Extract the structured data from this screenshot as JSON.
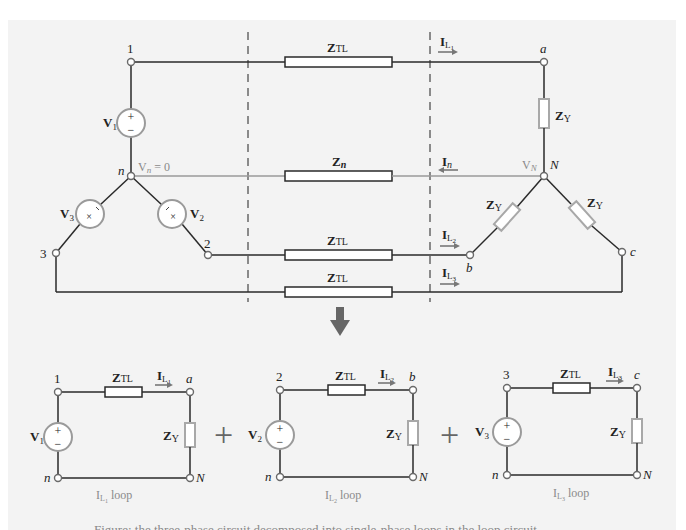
{
  "diagram": {
    "top_circuit": {
      "source_nodes": {
        "node1": "1",
        "node2": "2",
        "node3": "3",
        "neutral": "n"
      },
      "load_nodes": {
        "a": "a",
        "b": "b",
        "c": "c",
        "neutral": "N"
      },
      "sources": {
        "v1": "V",
        "v1_sub": "1",
        "v2": "V",
        "v2_sub": "2",
        "v3": "V",
        "v3_sub": "3"
      },
      "neutral_voltage_label": {
        "v": "V",
        "sub": "n",
        "rest": " = 0"
      },
      "load_neutral_voltage_label": {
        "v": "V",
        "sub": "N"
      },
      "line_impedance": {
        "z": "Z",
        "sub": "TL"
      },
      "neutral_impedance": {
        "z": "Z",
        "sub": "n"
      },
      "load_impedance": {
        "z": "Z",
        "sub": "Y"
      },
      "currents": {
        "il1": {
          "i": "I",
          "sub": "L",
          "subsub": "1"
        },
        "il2": {
          "i": "I",
          "sub": "L",
          "subsub": "2"
        },
        "il3": {
          "i": "I",
          "sub": "L",
          "subsub": "3"
        },
        "in": {
          "i": "I",
          "sub": "n"
        }
      }
    },
    "operator": "+",
    "loops": [
      {
        "source_node": "1",
        "load_node": "a",
        "v": "V",
        "v_sub": "1",
        "current_sub": "1",
        "caption_rest": " loop"
      },
      {
        "source_node": "2",
        "load_node": "b",
        "v": "V",
        "v_sub": "2",
        "current_sub": "2",
        "caption_rest": " loop"
      },
      {
        "source_node": "3",
        "load_node": "c",
        "v": "V",
        "v_sub": "3",
        "current_sub": "3",
        "caption_rest": " loop"
      }
    ],
    "loop_common": {
      "neutral_source": "n",
      "neutral_load": "N",
      "z": "Z",
      "ztl_sub": "TL",
      "zy_sub": "Y",
      "i": "I",
      "i_sub": "L",
      "plus": "+",
      "minus": "−"
    },
    "caption_clipped": "Figure: the three-phase circuit decomposed into single-phase loops in the loop circuit"
  },
  "colors": {
    "panel_bg": "#f3f3f3",
    "wire": "#2a2a2a",
    "neutral_wire": "#9a9a9a",
    "source_circle": "#9a9a9a",
    "load_impedance": "#a8a8a8",
    "dashed_line": "#8a8a8a",
    "arrow": "#6a6a6a"
  }
}
